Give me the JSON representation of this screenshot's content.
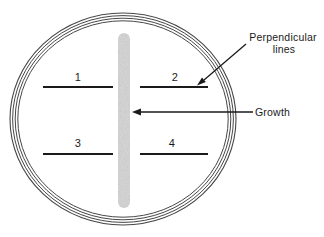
{
  "petri_dish": {
    "line_labels": [
      "1",
      "2",
      "3",
      "4"
    ],
    "annotations": {
      "perpendicular_line1": "Perpendicular",
      "perpendicular_line2": "lines",
      "growth": "Growth"
    },
    "colors": {
      "ink": "#1a1a1a",
      "rim": "#474747",
      "streak": "#d4d4d4",
      "background": "#ffffff"
    }
  }
}
